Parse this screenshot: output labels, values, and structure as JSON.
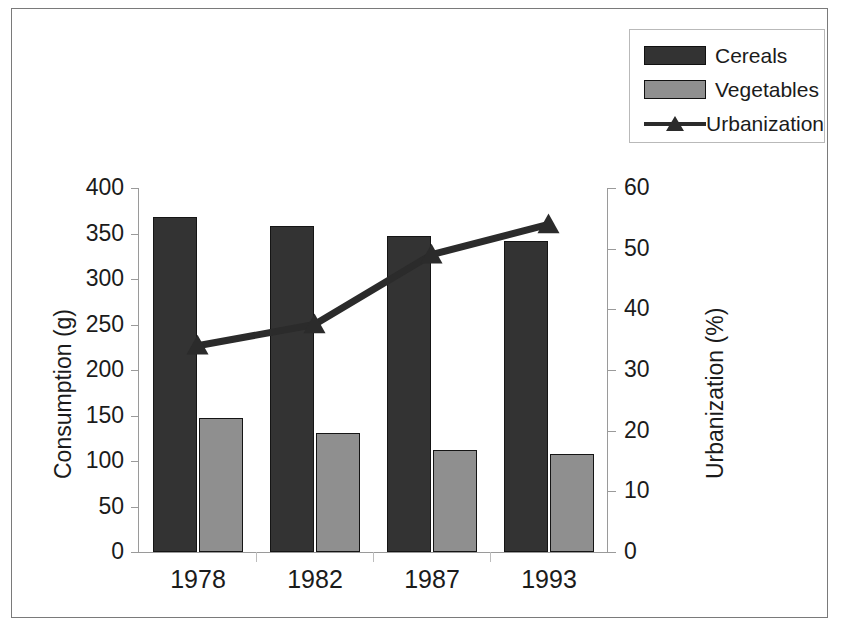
{
  "legend": {
    "position": "top-right",
    "items": [
      {
        "label": "Cereals",
        "key": "dark-bar-swatch",
        "color": "#333333"
      },
      {
        "label": "Vegetables",
        "key": "gray-bar-swatch",
        "color": "#8f8f8f"
      },
      {
        "label": "Urbanization",
        "key": "line-triangle-marker",
        "color": "#2b2b2b"
      }
    ]
  },
  "axes": {
    "left": {
      "title": "Consumption (g)",
      "ticks": [
        "400",
        "350",
        "300",
        "250",
        "200",
        "150",
        "100",
        "50",
        "0"
      ]
    },
    "right": {
      "title": "Urbanization (%)",
      "ticks": [
        "60",
        "50",
        "40",
        "30",
        "20",
        "10",
        "0"
      ]
    },
    "x": {
      "ticks": [
        "1978",
        "1982",
        "1987",
        "1993"
      ]
    }
  },
  "chart_data": {
    "type": "bar",
    "title": "",
    "subtitle": "",
    "xlabel": "",
    "ylabel": "Consumption (g)",
    "y2label": "Urbanization (%)",
    "categories": [
      "1978",
      "1982",
      "1987",
      "1993"
    ],
    "ylim": [
      0,
      400
    ],
    "y2lim": [
      0,
      60
    ],
    "ytick_step": 50,
    "y2tick_step": 10,
    "grid": false,
    "legend_position": "top-right",
    "series": [
      {
        "name": "Cereals",
        "kind": "bar",
        "axis": "left",
        "color": "#333333",
        "values": [
          368,
          358,
          347,
          342
        ]
      },
      {
        "name": "Vegetables",
        "kind": "bar",
        "axis": "left",
        "color": "#8f8f8f",
        "values": [
          147,
          131,
          112,
          108
        ]
      },
      {
        "name": "Urbanization",
        "kind": "line",
        "axis": "right",
        "color": "#2b2b2b",
        "marker": "triangle",
        "values": [
          34,
          37.5,
          49,
          54
        ]
      }
    ]
  }
}
